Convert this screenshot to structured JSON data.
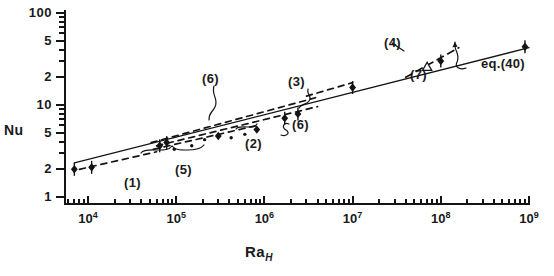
{
  "figure": {
    "kind": "log-log-scatter-with-fit-lines",
    "background_color": "#ffffff",
    "ink_color": "#141414"
  },
  "axes": {
    "y": {
      "label": "Nu",
      "scale": "log",
      "range": [
        1,
        100
      ],
      "tick_labels": [
        "100",
        "5",
        "2",
        "10",
        "5",
        "2",
        "1"
      ],
      "tick_values": [
        100,
        50,
        20,
        10,
        5,
        2,
        1
      ]
    },
    "x": {
      "label": "Ra",
      "label_subscript": "H",
      "scale": "log",
      "range": [
        5000,
        1000000000
      ],
      "tick_labels": [
        "10",
        "10",
        "10",
        "10",
        "10",
        "10"
      ],
      "tick_exponents": [
        "4",
        "5",
        "6",
        "7",
        "8",
        "9"
      ],
      "tick_values": [
        10000,
        100000,
        1000000,
        10000000,
        100000000,
        1000000000
      ]
    }
  },
  "annotations": [
    {
      "id": "ann-1",
      "text": "(1)",
      "x": 124,
      "y": 176
    },
    {
      "id": "ann-5",
      "text": "(5)",
      "x": 175,
      "y": 163
    },
    {
      "id": "ann-6a",
      "text": "(6)",
      "x": 202,
      "y": 72
    },
    {
      "id": "ann-2",
      "text": "(2)",
      "x": 245,
      "y": 137
    },
    {
      "id": "ann-6b",
      "text": "(6)",
      "x": 292,
      "y": 118
    },
    {
      "id": "ann-3",
      "text": "(3)",
      "x": 288,
      "y": 75
    },
    {
      "id": "ann-4",
      "text": "(4)",
      "x": 384,
      "y": 36
    },
    {
      "id": "ann-7",
      "text": "(7)",
      "x": 410,
      "y": 68
    },
    {
      "id": "ann-eq40",
      "text": "eq.(40)",
      "x": 481,
      "y": 57
    }
  ],
  "chart_data": {
    "type": "scatter",
    "title": "",
    "xlabel": "Ra_H",
    "ylabel": "Nu",
    "xscale": "log",
    "yscale": "log",
    "xlim": [
      5000,
      1000000000
    ],
    "ylim": [
      1,
      100
    ],
    "grid": false,
    "legend_position": "inline-annotations",
    "series": [
      {
        "name": "eq.(40)",
        "style": "solid-line",
        "annotation": "eq.(40)",
        "points": [
          {
            "x": 7000,
            "y": 2.35
          },
          {
            "x": 1000000000,
            "y": 42
          }
        ]
      },
      {
        "name": "(1)",
        "style": "dashed-line",
        "annotation": "(1)",
        "points": [
          {
            "x": 8000,
            "y": 2.0
          },
          {
            "x": 60000,
            "y": 3.1
          }
        ]
      },
      {
        "name": "(5)",
        "style": "dashed-line",
        "annotation": "(5)",
        "points": [
          {
            "x": 55000,
            "y": 3.3
          },
          {
            "x": 900000,
            "y": 6.1
          }
        ]
      },
      {
        "name": "(2)",
        "style": "dashed-line",
        "annotation": "(2)",
        "points": [
          {
            "x": 60000,
            "y": 3.6
          },
          {
            "x": 4000000,
            "y": 9.6
          }
        ]
      },
      {
        "name": "(6)",
        "style": "dashed-line",
        "annotation": "(6)",
        "points": [
          {
            "x": 52000,
            "y": 3.9
          },
          {
            "x": 3800000,
            "y": 12.0
          }
        ]
      },
      {
        "name": "(3)",
        "style": "dashed-line",
        "annotation": "(3)",
        "points": [
          {
            "x": 3000000,
            "y": 12.5
          },
          {
            "x": 10000000,
            "y": 17.5
          }
        ]
      },
      {
        "name": "(4)",
        "style": "dashed-line-short",
        "annotation": "(4)",
        "points": [
          {
            "x": 40000000,
            "y": 20
          },
          {
            "x": 160000000,
            "y": 42
          }
        ]
      }
    ],
    "data_points": [
      {
        "x": 7000,
        "y": 2.0,
        "marker": "filled",
        "error_bar": true
      },
      {
        "x": 11000,
        "y": 2.1,
        "marker": "filled",
        "error_bar": true
      },
      {
        "x": 65000,
        "y": 3.6,
        "marker": "filled",
        "error_bar": true
      },
      {
        "x": 78000,
        "y": 3.9,
        "marker": "filled",
        "error_bar": true
      },
      {
        "x": 95000,
        "y": 3.3,
        "marker": "dot",
        "error_bar": false
      },
      {
        "x": 150000,
        "y": 3.6,
        "marker": "dot",
        "error_bar": false
      },
      {
        "x": 210000,
        "y": 4.2,
        "marker": "dot",
        "error_bar": false
      },
      {
        "x": 300000,
        "y": 4.6,
        "marker": "filled",
        "error_bar": false
      },
      {
        "x": 420000,
        "y": 4.4,
        "marker": "dot",
        "error_bar": false
      },
      {
        "x": 600000,
        "y": 4.8,
        "marker": "dot",
        "error_bar": false
      },
      {
        "x": 820000,
        "y": 5.4,
        "marker": "filled",
        "error_bar": false
      },
      {
        "x": 1700000,
        "y": 7.2,
        "marker": "filled",
        "error_bar": true
      },
      {
        "x": 2400000,
        "y": 8.0,
        "marker": "filled",
        "error_bar": true
      },
      {
        "x": 10000000,
        "y": 15.5,
        "marker": "filled",
        "error_bar": true
      },
      {
        "x": 70000000,
        "y": 26.0,
        "marker": "open-triangle",
        "error_bar": false
      },
      {
        "x": 100000000,
        "y": 30.0,
        "marker": "filled",
        "error_bar": true
      },
      {
        "x": 900000000,
        "y": 43.0,
        "marker": "filled",
        "error_bar": true
      }
    ]
  }
}
